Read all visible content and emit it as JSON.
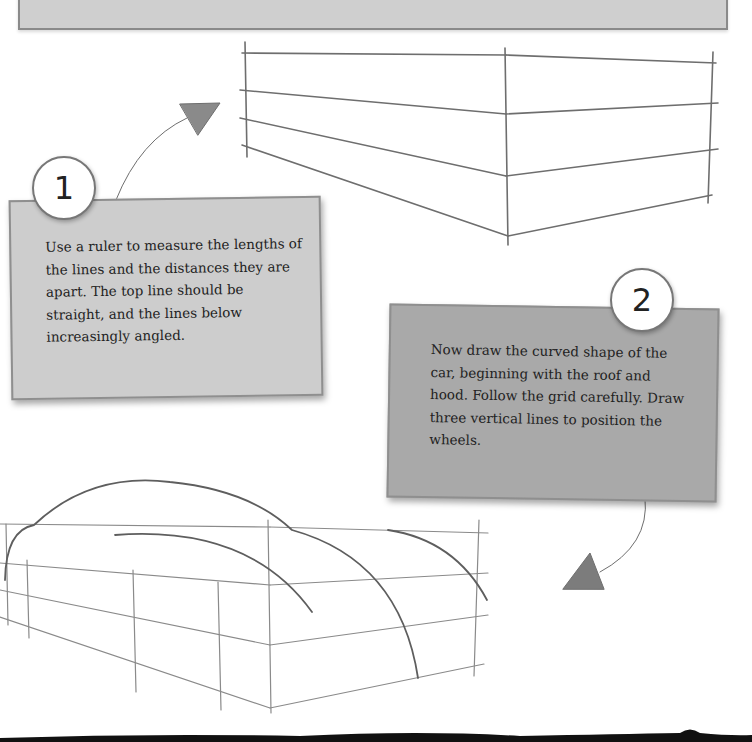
{
  "page": {
    "background": "#ffffff",
    "panel_color": "#cdcdcd",
    "panel_dark_color": "#a9a9a9",
    "pencil_color": "#6e6e6e"
  },
  "steps": [
    {
      "number": "1",
      "text": "Use a ruler to measure the lengths of the lines and the distances they are apart. The top line should be straight, and the lines below increasingly angled."
    },
    {
      "number": "2",
      "text": "Now draw the curved shape of the car, beginning with the roof and hood. Follow the grid carefully. Draw three vertical lines to position the wheels."
    }
  ],
  "illustrations": [
    {
      "name": "perspective-grid",
      "description": "box grid of four horizontal lines angled in perspective with three vertical lines"
    },
    {
      "name": "car-outline-sketch",
      "description": "grid with curved roof and hood lines and three vertical wheel-position lines"
    }
  ]
}
